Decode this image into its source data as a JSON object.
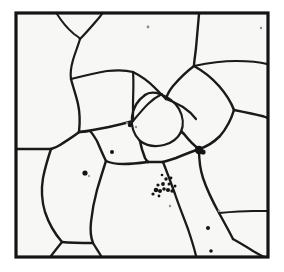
{
  "figure": {
    "kind": "micrograph",
    "caption": "",
    "background_color": "#ffffff",
    "interior_color": "#f7f7f5",
    "line_color": "#1a1a1a",
    "particle_color": "#141414"
  },
  "frame": {
    "x": 16,
    "y": 13,
    "width": 252,
    "height": 244,
    "stroke_width": 3.2,
    "color": "#141414"
  },
  "image_size": {
    "width": 284,
    "height": 272
  },
  "grain_boundaries": [
    {
      "id": "gb-top-left-branch",
      "width": 2.0,
      "d": "M 57,14 C 62,22 68,29 74,34 C 77,36 79,37 80,39"
    },
    {
      "id": "gb-top-right-branch",
      "width": 2.2,
      "d": "M 80,39 C 86,33 92,26 98,19 C 100,17 101,15 102,14"
    },
    {
      "id": "gb-upper-stem",
      "width": 2.2,
      "d": "M 80,39 C 78,46 75,53 73,60 C 71,67 70,73 71,79"
    },
    {
      "id": "gb-stem-to-junction",
      "width": 2.4,
      "d": "M 71,79 C 73,87 76,95 78,104 C 80,113 80,123 79,132"
    },
    {
      "id": "gb-junction-left-to-border",
      "width": 2.4,
      "d": "M 79,132 C 73,137 66,141 60,145 C 57,147 54,148 51,149"
    },
    {
      "id": "gb-border-left-stub",
      "width": 2.6,
      "d": "M 51,149 L 17,149"
    },
    {
      "id": "gb-junction-down-left",
      "width": 2.4,
      "d": "M 51,149 C 48,158 45,168 43,178 C 41,190 42,202 45,212 C 49,224 55,234 62,242"
    },
    {
      "id": "gb-junction-to-center",
      "width": 2.4,
      "d": "M 79,132 C 89,131 99,129 109,127 C 118,125 126,123 133,121"
    },
    {
      "id": "gb-upperleft-to-center-top",
      "width": 2.2,
      "d": "M 71,79 C 83,76 95,73 107,71 C 117,70 126,70 133,72"
    },
    {
      "id": "gb-center-top-ridge",
      "width": 2.4,
      "d": "M 133,72 C 141,76 148,81 154,87 C 159,92 163,96 166,99"
    },
    {
      "id": "gb-center-left-wall",
      "width": 2.2,
      "d": "M 133,72 C 134,83 133,94 133,105 C 133,113 133,118 133,121"
    },
    {
      "id": "gb-pocket-diag",
      "width": 2.0,
      "d": "M 133,121 C 138,115 143,109 148,104 C 153,99 158,96 162,94"
    },
    {
      "id": "gb-round-grain-left",
      "width": 2.3,
      "d": "M 145,95 C 138,100 133,108 132,117 C 131,126 134,135 140,141"
    },
    {
      "id": "gb-round-grain-bottom",
      "width": 2.3,
      "d": "M 140,141 C 147,146 156,147 164,145 C 172,143 178,138 181,132"
    },
    {
      "id": "gb-round-grain-right",
      "width": 2.3,
      "d": "M 181,132 C 184,125 183,116 179,109 C 175,102 168,97 160,94 C 154,92 149,92 145,95"
    },
    {
      "id": "gb-triangle-right-edge",
      "width": 2.2,
      "d": "M 166,99 C 172,101 178,104 183,107 C 189,111 193,115 196,119"
    },
    {
      "id": "gb-diamond-top",
      "width": 2.4,
      "d": "M 199,14 C 198,25 197,37 196,48 C 195,57 194,62 194,66"
    },
    {
      "id": "gb-diamond-upper-left",
      "width": 2.4,
      "d": "M 194,66 C 186,72 179,79 173,86 C 169,91 167,95 166,99"
    },
    {
      "id": "gb-diamond-upper-right",
      "width": 2.5,
      "d": "M 194,66 C 203,71 212,78 219,86 C 226,94 231,102 234,110"
    },
    {
      "id": "gb-diamond-lower-right",
      "width": 2.5,
      "d": "M 234,110 C 231,120 226,129 220,136 C 213,143 206,147 199,149"
    },
    {
      "id": "gb-diamond-lower-left",
      "width": 2.6,
      "d": "M 199,149 C 193,145 188,139 184,134 C 182,132 181,131 181,132"
    },
    {
      "id": "gb-right-top-to-border",
      "width": 2.2,
      "d": "M 194,66 C 208,63 222,61 236,61 C 249,61 260,62 267,64"
    },
    {
      "id": "gb-right-mid-to-border",
      "width": 2.4,
      "d": "M 234,110 C 244,112 254,114 262,116 C 265,117 266,117 267,118"
    },
    {
      "id": "gb-blob-down",
      "width": 2.4,
      "d": "M 199,149 C 199,159 200,169 203,178 C 207,190 213,202 219,213 C 224,222 229,231 233,239"
    },
    {
      "id": "gb-blob-left",
      "width": 2.6,
      "d": "M 199,149 C 191,152 183,155 176,158 C 170,160 166,161 163,162"
    },
    {
      "id": "gb-center-bottom-wall",
      "width": 2.5,
      "d": "M 140,141 C 141,147 143,153 145,158 C 146,160 147,161 148,162"
    },
    {
      "id": "gb-lower-center-junction",
      "width": 2.6,
      "d": "M 148,162 L 163,162"
    },
    {
      "id": "gb-lower-center-left",
      "width": 2.4,
      "d": "M 148,162 C 140,163 132,164 124,164 C 116,164 110,163 106,161"
    },
    {
      "id": "gb-lower-left-grain-wall",
      "width": 2.4,
      "d": "M 106,161 C 103,155 100,148 97,141 C 94,136 92,133 90,131"
    },
    {
      "id": "gb-lower-left-to-junction",
      "width": 2.3,
      "d": "M 90,131 C 86,132 83,132 81,132 C 80,132 79,132 79,132"
    },
    {
      "id": "gb-lower-left-down",
      "width": 2.4,
      "d": "M 106,161 C 103,170 100,180 97,190 C 94,201 92,212 91,222 C 90,231 91,238 93,243"
    },
    {
      "id": "gb-bottom-junction-left",
      "width": 2.3,
      "d": "M 62,242 C 72,243 82,243 93,243"
    },
    {
      "id": "gb-bottom-junction-down",
      "width": 2.3,
      "d": "M 93,243 C 96,248 99,252 101,256"
    },
    {
      "id": "gb-bottom-left-down",
      "width": 2.3,
      "d": "M 62,242 C 58,247 54,252 51,256"
    },
    {
      "id": "gb-lower-right-wall",
      "width": 2.3,
      "d": "M 163,162 C 167,172 171,183 175,194 C 179,206 184,218 188,229 C 191,238 194,247 196,256"
    },
    {
      "id": "gb-bottom-right-to-border",
      "width": 2.2,
      "d": "M 233,239 C 240,243 247,247 253,251 C 258,254 262,256 264,257"
    },
    {
      "id": "gb-right-lower-to-border",
      "width": 2.2,
      "d": "M 219,213 C 230,212 242,211 253,211 C 260,211 265,211 267,211"
    }
  ],
  "inclusions": [
    {
      "id": "particle-center-cluster-1",
      "cx": 156,
      "cy": 190,
      "r": 2.3
    },
    {
      "id": "particle-center-cluster-2",
      "cx": 160,
      "cy": 191,
      "r": 2.0
    },
    {
      "id": "particle-center-cluster-3",
      "cx": 164,
      "cy": 189,
      "r": 1.8
    },
    {
      "id": "particle-center-cluster-4",
      "cx": 168,
      "cy": 190,
      "r": 2.1
    },
    {
      "id": "particle-center-cluster-5",
      "cx": 172,
      "cy": 191,
      "r": 1.7
    },
    {
      "id": "particle-center-cluster-6",
      "cx": 158,
      "cy": 185,
      "r": 1.6
    },
    {
      "id": "particle-center-cluster-7",
      "cx": 163,
      "cy": 184,
      "r": 1.9
    },
    {
      "id": "particle-center-cluster-8",
      "cx": 169,
      "cy": 184,
      "r": 1.5
    },
    {
      "id": "particle-center-cluster-9",
      "cx": 166,
      "cy": 179,
      "r": 1.7
    },
    {
      "id": "particle-center-cluster-10",
      "cx": 171,
      "cy": 178,
      "r": 1.4
    },
    {
      "id": "particle-center-cluster-11",
      "cx": 162,
      "cy": 175,
      "r": 1.3
    },
    {
      "id": "particle-center-cluster-12",
      "cx": 175,
      "cy": 186,
      "r": 1.5
    },
    {
      "id": "particle-center-cluster-13",
      "cx": 153,
      "cy": 194,
      "r": 1.6
    },
    {
      "id": "particle-center-cluster-14",
      "cx": 159,
      "cy": 196,
      "r": 1.4
    },
    {
      "id": "particle-blob-right",
      "cx": 199,
      "cy": 150,
      "r": 4.2
    },
    {
      "id": "particle-blob-right-tail",
      "cx": 203,
      "cy": 152,
      "r": 2.6
    },
    {
      "id": "particle-left-mid",
      "cx": 85,
      "cy": 173,
      "r": 2.6
    },
    {
      "id": "particle-left-upper",
      "cx": 112,
      "cy": 152,
      "r": 2.0
    },
    {
      "id": "particle-center-left",
      "cx": 130,
      "cy": 125,
      "r": 2.2
    },
    {
      "id": "particle-lower-right",
      "cx": 208,
      "cy": 228,
      "r": 2.0
    },
    {
      "id": "particle-bottom-edge",
      "cx": 211,
      "cy": 251,
      "r": 1.8
    }
  ],
  "faint_marks": [
    {
      "id": "mark-top-center",
      "cx": 148,
      "cy": 27,
      "r": 1.4
    },
    {
      "id": "mark-top-right",
      "cx": 261,
      "cy": 28,
      "r": 1.2
    },
    {
      "id": "mark-center-upper",
      "cx": 127,
      "cy": 123,
      "r": 1.3
    },
    {
      "id": "mark-center-mid",
      "cx": 136,
      "cy": 127,
      "r": 1.2
    },
    {
      "id": "mark-right-lower",
      "cx": 219,
      "cy": 211,
      "r": 1.3
    },
    {
      "id": "mark-bottom-center",
      "cx": 170,
      "cy": 206,
      "r": 1.2
    },
    {
      "id": "mark-left-lower",
      "cx": 89,
      "cy": 176,
      "r": 1.1
    }
  ]
}
